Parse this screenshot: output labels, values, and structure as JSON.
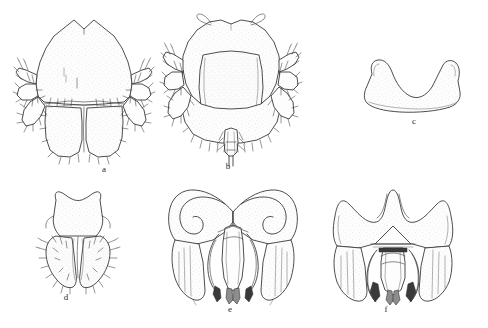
{
  "figure": {
    "kind": "scientific-line-drawing-plate",
    "background_color": "#ffffff",
    "ink_color": "#3a3a3a",
    "panel_count": 6,
    "panels": [
      {
        "id": "a",
        "label": "a",
        "subject": "labium-with-palps-dorsal",
        "description": "Broad shield-shaped plate with a median V-notch on the anterior margin, two lateral palps bearing dense setae, and two rounded basal lobes below.",
        "label_x": 104,
        "label_y": 168
      },
      {
        "id": "b",
        "label": "b",
        "subject": "maxilla-with-palps-ventral",
        "description": "Rounded head capsule with two small apical tubercles, a large central rectangular lobe, lateral setose palps and a narrow median apical process.",
        "label_x": 228,
        "label_y": 165
      },
      {
        "id": "c",
        "label": "c",
        "subject": "bilobed-plate",
        "description": "Transverse plate with a deep median V-shaped emargination flanked by two pointed horn-like lobes; ventral margin gently sinuate.",
        "label_x": 414,
        "label_y": 120
      },
      {
        "id": "d",
        "label": "d",
        "subject": "hypopharynx",
        "description": "Small waisted sclerite with a shallow apical notch and two elongate setose distal lobes separated by a narrow median cleft.",
        "label_x": 66,
        "label_y": 296
      },
      {
        "id": "e",
        "label": "e",
        "subject": "male-genitalia-ventral",
        "description": "Genital capsule with two broad lateral plates enclosing hook-shaped inner arms, a median tubular aedeagus and two long descending parameres.",
        "label_x": 230,
        "label_y": 308
      },
      {
        "id": "f",
        "label": "f",
        "subject": "male-genitalia-dorsal",
        "description": "Genital capsule with a deep U-shaped dorsal emargination, triangular median plate, paired sclerotized inner rods and two long descending parameres.",
        "label_x": 386,
        "label_y": 308
      }
    ]
  }
}
